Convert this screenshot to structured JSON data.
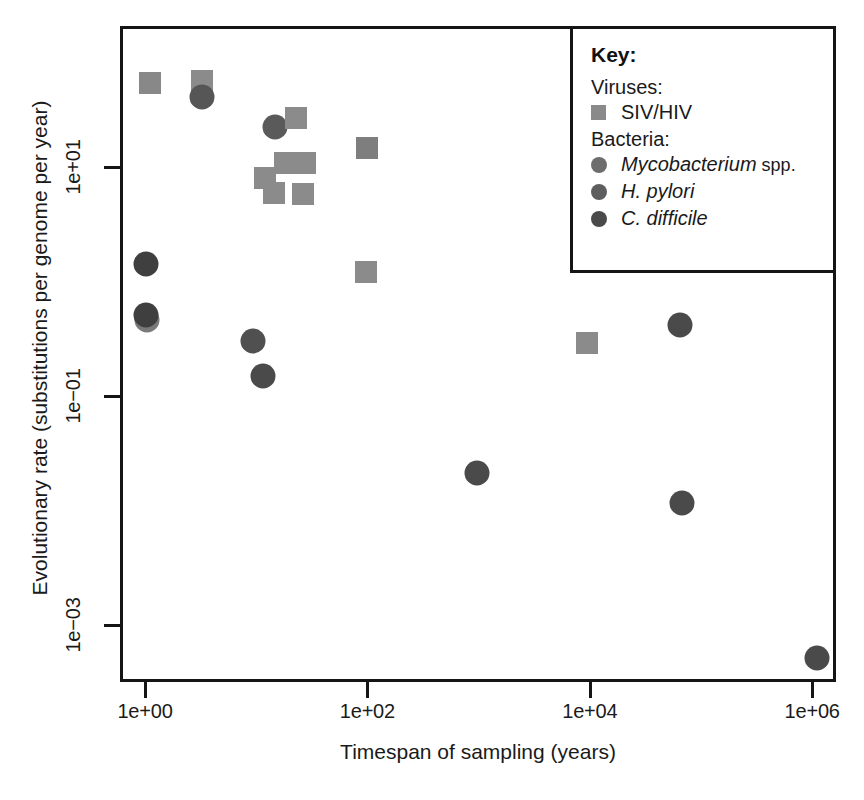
{
  "chart_data": {
    "type": "scatter",
    "title": "",
    "xlabel": "Timespan of sampling (years)",
    "ylabel": "Evolutionary rate (substitutions per genome per year)",
    "xscale": "log",
    "yscale": "log",
    "xlim": [
      0.78,
      2400000
    ],
    "ylim": [
      0.00035,
      62
    ],
    "grid": false,
    "xticks": [
      {
        "value": 1,
        "label": "1e+00"
      },
      {
        "value": 100,
        "label": "1e+02"
      },
      {
        "value": 10000,
        "label": "1e+04"
      },
      {
        "value": 1000000,
        "label": "1e+06"
      }
    ],
    "yticks": [
      {
        "value": 10,
        "label": "1e+01"
      },
      {
        "value": 0.1,
        "label": "1e-01"
      },
      {
        "value": 0.001,
        "label": "1e-03"
      }
    ],
    "legend": {
      "position": "top-right",
      "title": "Key:",
      "groups": [
        {
          "group_label": "Viruses:",
          "entries": [
            {
              "label": "SIV/HIV",
              "label_italic": "",
              "marker": "square",
              "color": "#8a8a8a"
            }
          ]
        },
        {
          "group_label": "Bacteria:",
          "entries": [
            {
              "label": "Mycobacterium",
              "label_italic": "Mycobacterium",
              "label_plain": " spp.",
              "marker": "circle",
              "color": "#6d6d6d"
            },
            {
              "label": "H. pylori",
              "label_italic": "H. pylori",
              "label_plain": "",
              "marker": "circle",
              "color": "#5e5e5e"
            },
            {
              "label": "C. difficile",
              "label_italic": "C. difficile",
              "label_plain": "",
              "marker": "circle",
              "color": "#4a4a4a"
            }
          ]
        }
      ]
    },
    "series": [
      {
        "name": "SIV/HIV",
        "marker": "square",
        "color": "#8a8a8a",
        "points": [
          {
            "x": 1.0,
            "y": 33.0
          },
          {
            "x": 1.7,
            "y": 34.0
          },
          {
            "x": 6.0,
            "y": 22.0
          },
          {
            "x": 10.0,
            "y": 9.0
          },
          {
            "x": 13.0,
            "y": 9.3
          },
          {
            "x": 4.6,
            "y": 7.3
          },
          {
            "x": 5.6,
            "y": 6.2
          },
          {
            "x": 9.0,
            "y": 6.2
          },
          {
            "x": 100.0,
            "y": 14.0
          },
          {
            "x": 100.0,
            "y": 1.1
          },
          {
            "x": 9800.0,
            "y": 0.3
          }
        ]
      },
      {
        "name": "Mycobacterium spp.",
        "marker": "circle",
        "color": "#6d6d6d",
        "points": [
          {
            "x": 1.7,
            "y": 25.0
          },
          {
            "x": 4.3,
            "y": 17.0
          },
          {
            "x": 1.0,
            "y": 0.42
          },
          {
            "x": 3.5,
            "y": 0.28
          },
          {
            "x": 5.1,
            "y": 0.16
          },
          {
            "x": 70000.0,
            "y": 0.34
          }
        ]
      },
      {
        "name": "H. pylori",
        "marker": "circle",
        "color": "#5e5e5e",
        "points": [
          {
            "x": 1.0,
            "y": 0.4
          },
          {
            "x": 1000.0,
            "y": 0.02
          }
        ]
      },
      {
        "name": "C. difficile",
        "marker": "circle",
        "color": "#4a4a4a",
        "points": [
          {
            "x": 1.0,
            "y": 1.3
          },
          {
            "x": 70000.0,
            "y": 0.009
          },
          {
            "x": 1100000.0,
            "y": 0.00055
          }
        ]
      }
    ],
    "points_pixel": [
      {
        "shape": "square",
        "color": "#888888",
        "px": 150,
        "py": 83
      },
      {
        "shape": "square",
        "color": "#8b8b8b",
        "px": 202,
        "py": 81
      },
      {
        "shape": "circle",
        "color": "#565656",
        "px": 202,
        "py": 97
      },
      {
        "shape": "circle",
        "color": "#5a5a5a",
        "px": 275,
        "py": 127
      },
      {
        "shape": "square",
        "color": "#8b8b8b",
        "px": 296,
        "py": 118
      },
      {
        "shape": "square",
        "color": "#8b8b8b",
        "px": 285,
        "py": 163
      },
      {
        "shape": "square",
        "color": "#8b8b8b",
        "px": 305,
        "py": 163
      },
      {
        "shape": "square",
        "color": "#8b8b8b",
        "px": 265,
        "py": 178
      },
      {
        "shape": "square",
        "color": "#8b8b8b",
        "px": 274,
        "py": 193
      },
      {
        "shape": "square",
        "color": "#8b8b8b",
        "px": 303,
        "py": 194
      },
      {
        "shape": "square",
        "color": "#7e7e7e",
        "px": 367,
        "py": 148
      },
      {
        "shape": "square",
        "color": "#8b8b8b",
        "px": 366,
        "py": 272
      },
      {
        "shape": "circle",
        "color": "#3f3f3f",
        "px": 146,
        "py": 264
      },
      {
        "shape": "circle",
        "color": "#7a7a7a",
        "px": 147,
        "py": 320
      },
      {
        "shape": "circle",
        "color": "#3f3f3f",
        "px": 146,
        "py": 315
      },
      {
        "shape": "circle",
        "color": "#505050",
        "px": 253,
        "py": 341
      },
      {
        "shape": "circle",
        "color": "#4a4a4a",
        "px": 263,
        "py": 376
      },
      {
        "shape": "square",
        "color": "#8b8b8b",
        "px": 587,
        "py": 343
      },
      {
        "shape": "circle",
        "color": "#4a4a4a",
        "px": 680,
        "py": 325
      },
      {
        "shape": "circle",
        "color": "#4a4a4a",
        "px": 477,
        "py": 473
      },
      {
        "shape": "circle",
        "color": "#4a4a4a",
        "px": 682,
        "py": 503
      },
      {
        "shape": "circle",
        "color": "#4a4a4a",
        "px": 817,
        "py": 658
      }
    ]
  }
}
